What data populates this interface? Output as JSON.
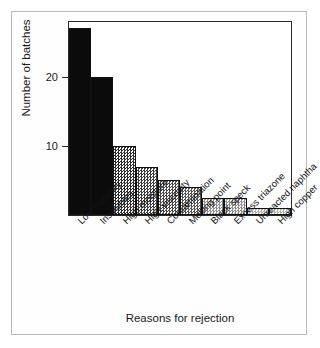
{
  "chart_data": {
    "type": "bar",
    "title": "",
    "subtitle": "",
    "xlabel": "Reasons for rejection",
    "ylabel": "Number of batches",
    "categories": [
      "Low viscosity",
      "Insolubles",
      "High moisture",
      "High viscosity",
      "Contamination",
      "Melting point",
      "Black speck",
      "Excess triazone",
      "Unreacted naphtha",
      "High copper"
    ],
    "values": [
      27,
      20,
      10,
      7,
      5,
      4,
      2.5,
      2.5,
      1,
      1
    ],
    "ylim": [
      0,
      27.9
    ],
    "xlim": [
      0,
      10
    ],
    "yticks": [
      10,
      20
    ],
    "ytick_labels": [
      "10",
      "20"
    ],
    "grid": false,
    "legend": false,
    "legend_position": "none",
    "bar_shades": [
      "#0b0b0b",
      "#0b0b0b",
      "#2e2e2e",
      "#3c3c3c",
      "#4a4a4a",
      "#555555",
      "#8e8e8e",
      "#8e8e8e",
      "#b0b0b0",
      "#b0b0b0"
    ],
    "annotations": []
  },
  "colors": {
    "plot_border": "#2a2a2a",
    "figure_border": "#b9b9b9",
    "background": "#ffffff",
    "text": "#1a1a1a"
  }
}
